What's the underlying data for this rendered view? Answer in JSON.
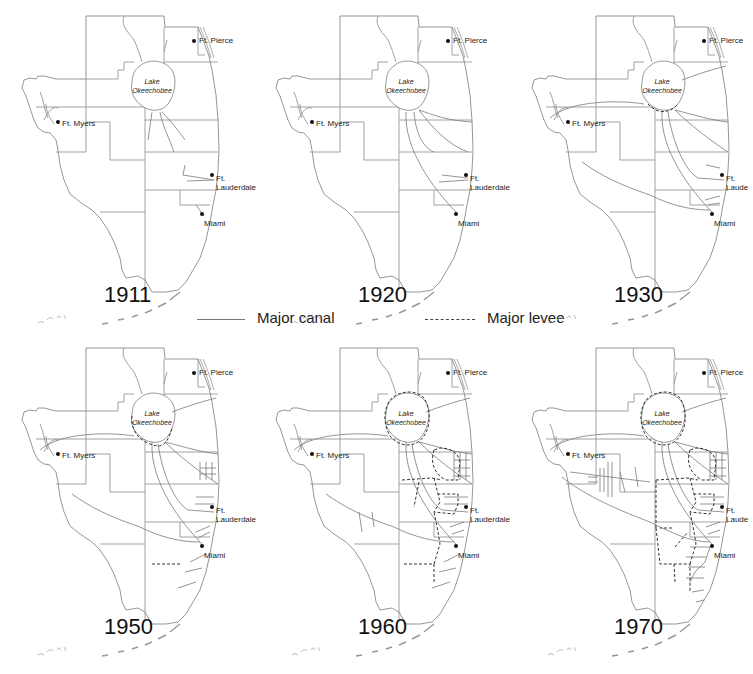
{
  "figure": {
    "legend": {
      "canal_label": "Major canal",
      "levee_label": "Major levee"
    },
    "colors": {
      "boundary": "#8a8a8a",
      "canal": "#7a7a7a",
      "levee": "#333333",
      "text": "#111111"
    },
    "lake_label": [
      "Lake",
      "Okeechobee"
    ],
    "cities": [
      {
        "name": "Ft. Pierce",
        "label": "Ft. Pierce"
      },
      {
        "name": "Ft. Myers",
        "label": "Ft. Myers"
      },
      {
        "name": "Ft. Lauderdale",
        "label": "Ft.\nLauderdale"
      },
      {
        "name": "Miami",
        "label": "Miami"
      }
    ],
    "panels": [
      {
        "year": "1911",
        "lauderdale_label": "Ft.\nLauderdale"
      },
      {
        "year": "1920",
        "lauderdale_label": "Ft.\nLauderdale"
      },
      {
        "year": "1930",
        "lauderdale_label": "Ft.\nLaude"
      },
      {
        "year": "1950",
        "lauderdale_label": "Ft.\nLauderdale"
      },
      {
        "year": "1960",
        "lauderdale_label": "Ft.\nLauderdale"
      },
      {
        "year": "1970",
        "lauderdale_label": "Ft.\nLaude"
      }
    ]
  }
}
